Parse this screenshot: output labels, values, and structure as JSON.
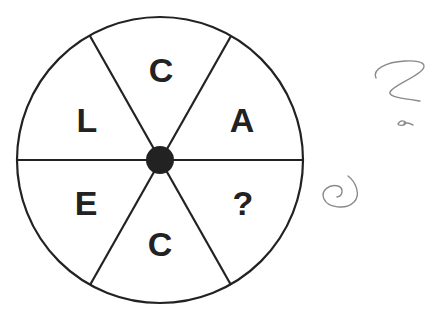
{
  "puzzle": {
    "segments": [
      {
        "position": "top",
        "letter": "C"
      },
      {
        "position": "upper-right",
        "letter": "A"
      },
      {
        "position": "lower-right",
        "letter": "?"
      },
      {
        "position": "bottom",
        "letter": "C"
      },
      {
        "position": "lower-left",
        "letter": "E"
      },
      {
        "position": "upper-left",
        "letter": "L"
      }
    ],
    "center_dot": "filled",
    "colors": {
      "ink": "#222222",
      "pencil": "#8a8a8a"
    }
  },
  "annotations": {
    "handwritten": [
      "question-mark-scribble",
      "small-mark",
      "spiral-scribble"
    ]
  }
}
